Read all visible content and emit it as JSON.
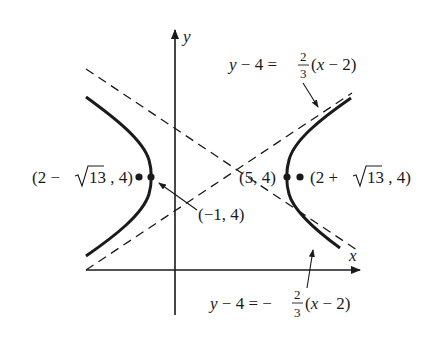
{
  "figure": {
    "type": "hyperbola-graph",
    "axes": {
      "x_label": "x",
      "y_label": "y"
    },
    "center": {
      "label": "(5, 4)",
      "note": "center of hyperbola at intersection of asymptotes"
    },
    "points": [
      {
        "id": "left-focus-dot",
        "label": "(2 − √13, 4)"
      },
      {
        "id": "right-focus-dot",
        "label": "(2 + √13, 4)"
      },
      {
        "id": "left-vertex",
        "label": "(−1, 4)"
      },
      {
        "id": "right-vertex",
        "label": "(5, 4)"
      }
    ],
    "labels": {
      "left_point": {
        "prefix": "(2 − ",
        "radicand": "13",
        "suffix": ", 4)"
      },
      "right_point": {
        "prefix": "(2 + ",
        "radicand": "13",
        "suffix": ", 4)"
      },
      "center_point": "(5, 4)",
      "vertex_point": "(−1, 4)"
    },
    "asymptotes": [
      {
        "id": "asymptote-positive",
        "lhs": "y − 4 = ",
        "num": "2",
        "den": "3",
        "rhs": "(x − 2)",
        "sign": ""
      },
      {
        "id": "asymptote-negative",
        "lhs": "y − 4 = ",
        "num": "2",
        "den": "3",
        "rhs": "(x − 2)",
        "sign": "−"
      }
    ],
    "colors": {
      "ink": "#1a1a1a",
      "background": "#ffffff"
    }
  }
}
